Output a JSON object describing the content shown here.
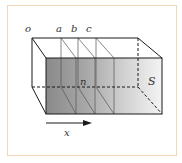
{
  "figure": {
    "labels": {
      "origin": "o",
      "plane_a": "a",
      "plane_b": "b",
      "plane_c": "c",
      "normal": "n",
      "surface": "S",
      "axis": "x"
    },
    "colors": {
      "frame_border": "#f3d6b8",
      "edge": "#1a1a1a",
      "shade_dark": "#8c8c8c",
      "shade_light": "#f2f2f2"
    }
  }
}
